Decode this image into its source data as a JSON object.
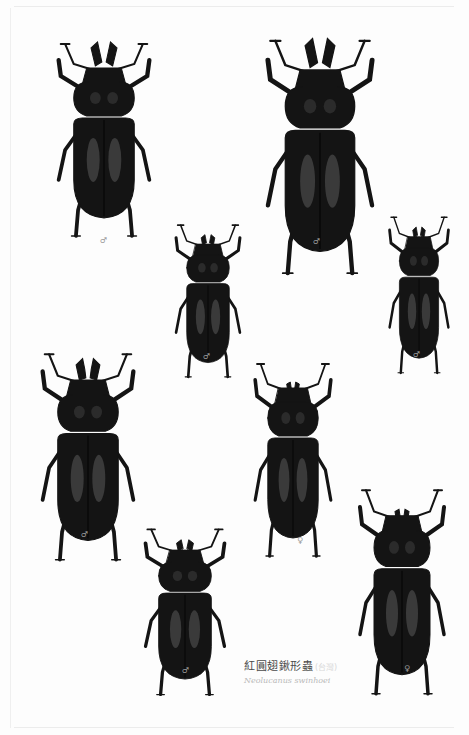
{
  "plate": {
    "background": "#fdfdfd",
    "specimen_color": "#141414",
    "highlight_color": "#5a5a5a"
  },
  "specimens": [
    {
      "id": "male-large-1",
      "sex": "♂",
      "x": 50,
      "y": 40,
      "w": 108,
      "h": 200,
      "mandible": "large"
    },
    {
      "id": "male-large-2",
      "sex": "♂",
      "x": 258,
      "y": 36,
      "w": 124,
      "h": 242,
      "mandible": "large"
    },
    {
      "id": "male-small-1",
      "sex": "♂",
      "x": 170,
      "y": 222,
      "w": 76,
      "h": 158,
      "mandible": "small"
    },
    {
      "id": "male-small-2",
      "sex": "♂",
      "x": 384,
      "y": 214,
      "w": 70,
      "h": 162,
      "mandible": "small"
    },
    {
      "id": "male-medium-1",
      "sex": "♂",
      "x": 34,
      "y": 350,
      "w": 108,
      "h": 214,
      "mandible": "medium"
    },
    {
      "id": "female-1",
      "sex": "♀",
      "x": 248,
      "y": 360,
      "w": 90,
      "h": 200,
      "mandible": "female"
    },
    {
      "id": "male-small-3",
      "sex": "♂",
      "x": 138,
      "y": 526,
      "w": 94,
      "h": 172,
      "mandible": "small"
    },
    {
      "id": "female-2",
      "sex": "♀",
      "x": 352,
      "y": 486,
      "w": 100,
      "h": 212,
      "mandible": "female"
    }
  ],
  "sex_labels": [
    {
      "symbol": "♂",
      "x": 100,
      "y": 236
    },
    {
      "symbol": "♂",
      "x": 313,
      "y": 237
    },
    {
      "symbol": "♂",
      "x": 203,
      "y": 352
    },
    {
      "symbol": "♂",
      "x": 413,
      "y": 350
    },
    {
      "symbol": "♂",
      "x": 81,
      "y": 530
    },
    {
      "symbol": "♀",
      "x": 297,
      "y": 536
    },
    {
      "symbol": "♂",
      "x": 182,
      "y": 666
    },
    {
      "symbol": "♀",
      "x": 404,
      "y": 664
    }
  ],
  "caption": {
    "chinese_name": "紅圓翅鍬形蟲",
    "chinese_suffix": "(台灣)",
    "scientific_name": "Neolucanus swinhoei"
  }
}
